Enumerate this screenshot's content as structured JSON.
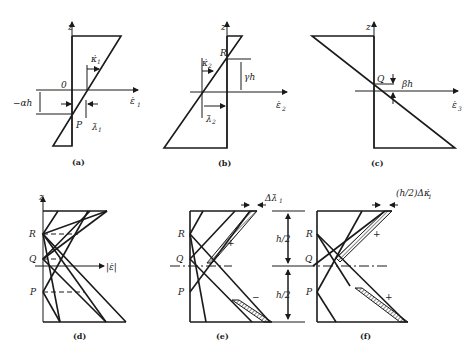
{
  "figure": {
    "panels": [
      {
        "id": "a",
        "caption": "(a)",
        "axis_z": "z",
        "axis_x": "ε̇",
        "axis_x_sub": "1",
        "origin": "0",
        "point": "P",
        "dim_left": "−αh",
        "rate_top": "κ̇",
        "rate_top_sub": "1",
        "rate_bottom": "λ̇",
        "rate_bottom_sub": "1"
      },
      {
        "id": "b",
        "caption": "(b)",
        "axis_z": "z",
        "axis_x": "ε̇",
        "axis_x_sub": "2",
        "point": "R",
        "dim_right": "γh",
        "rate_top": "κ̇",
        "rate_top_sub": "2",
        "rate_bottom": "λ̇",
        "rate_bottom_sub": "2"
      },
      {
        "id": "c",
        "caption": "(c)",
        "axis_z": "z",
        "axis_x": "ε̇",
        "axis_x_sub": "3",
        "point": "Q",
        "dim_right": "βh"
      },
      {
        "id": "d",
        "caption": "(d)",
        "axis_z": "z",
        "axis_x": "|ε̇|",
        "points": [
          "R",
          "Q",
          "P"
        ]
      },
      {
        "id": "e",
        "caption": "(e)",
        "points": [
          "R",
          "Q",
          "P"
        ],
        "top_annotation": "Δλ̇",
        "top_annotation_sub": "1",
        "sign_upper": "+",
        "sign_lower": "−",
        "half_upper": "h/2",
        "half_lower": "h/2"
      },
      {
        "id": "f",
        "caption": "(f)",
        "points": [
          "R",
          "Q",
          "P"
        ],
        "top_annotation": "(h/2)Δκ̇",
        "top_annotation_sub": "1",
        "sign_upper": "+",
        "sign_lower": "+"
      }
    ]
  }
}
